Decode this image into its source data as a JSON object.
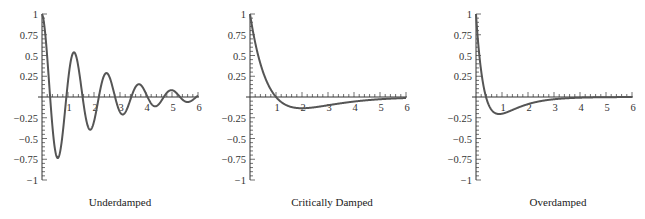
{
  "chart_data": [
    {
      "type": "line",
      "title": "Underdamped",
      "xlabel": "",
      "ylabel": "",
      "xlim": [
        0,
        6
      ],
      "ylim": [
        -1,
        1
      ],
      "x_ticks": [
        "1",
        "2",
        "3",
        "4",
        "5",
        "6"
      ],
      "y_ticks": [
        "1",
        "0.75",
        "0.5",
        "0.25",
        "-0.25",
        "-0.5",
        "-0.75",
        "-1"
      ],
      "grid": false,
      "model": {
        "kind": "underdamped",
        "decay": 0.5,
        "omega": 5.03
      },
      "key_points": [
        {
          "x": 0,
          "y": 1
        },
        {
          "x": 0.6,
          "y": -0.82
        },
        {
          "x": 1.2,
          "y": 0.6
        },
        {
          "x": 1.85,
          "y": -0.43
        },
        {
          "x": 2.45,
          "y": 0.32
        },
        {
          "x": 3.1,
          "y": -0.23
        },
        {
          "x": 3.7,
          "y": 0.16
        },
        {
          "x": 4.3,
          "y": -0.12
        },
        {
          "x": 4.95,
          "y": 0.08
        },
        {
          "x": 5.6,
          "y": -0.06
        },
        {
          "x": 6,
          "y": 0.0
        }
      ]
    },
    {
      "type": "line",
      "title": "Critically Damped",
      "xlabel": "",
      "ylabel": "",
      "xlim": [
        0,
        6
      ],
      "ylim": [
        -1,
        1
      ],
      "x_ticks": [
        "1",
        "2",
        "3",
        "4",
        "5",
        "6"
      ],
      "y_ticks": [
        "1",
        "0.75",
        "0.5",
        "0.25",
        "-0.25",
        "-0.5",
        "-0.75",
        "-1"
      ],
      "grid": false,
      "model": {
        "kind": "critical"
      },
      "key_points": [
        {
          "x": 0,
          "y": 1
        },
        {
          "x": 1,
          "y": 0
        },
        {
          "x": 2,
          "y": -0.135
        },
        {
          "x": 3,
          "y": -0.1
        },
        {
          "x": 4,
          "y": -0.055
        },
        {
          "x": 5,
          "y": -0.027
        },
        {
          "x": 6,
          "y": -0.012
        }
      ]
    },
    {
      "type": "line",
      "title": "Overdamped",
      "xlabel": "",
      "ylabel": "",
      "xlim": [
        0,
        6
      ],
      "ylim": [
        -1,
        1
      ],
      "x_ticks": [
        "1",
        "2",
        "3",
        "4",
        "5",
        "6"
      ],
      "y_ticks": [
        "1",
        "0.75",
        "0.5",
        "0.25",
        "-0.25",
        "-0.5",
        "-0.75",
        "-1"
      ],
      "grid": false,
      "model": {
        "kind": "over"
      },
      "key_points": [
        {
          "x": 0,
          "y": 1
        },
        {
          "x": 0.4,
          "y": 0
        },
        {
          "x": 0.9,
          "y": -0.2
        },
        {
          "x": 2,
          "y": -0.085
        },
        {
          "x": 3,
          "y": -0.027
        },
        {
          "x": 4,
          "y": -0.008
        },
        {
          "x": 6,
          "y": 0.0
        }
      ]
    }
  ],
  "captions": [
    "Underdamped",
    "Critically Damped",
    "Overdamped"
  ]
}
